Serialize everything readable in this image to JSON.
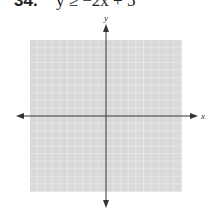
{
  "problem": {
    "number": "34.",
    "equation": "y ≥ −2x + 5"
  },
  "graph": {
    "x_axis_label": "x",
    "y_axis_label": "y",
    "grid_cells": 20,
    "grid_color": "#d9d9d9",
    "grid_line_color": "#f2f2f2",
    "axis_color": "#333333"
  }
}
